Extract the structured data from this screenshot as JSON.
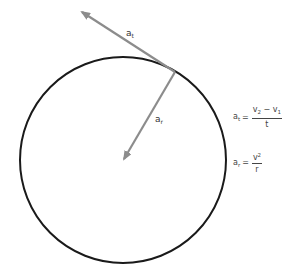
{
  "diagram": {
    "title": "",
    "colors": {
      "circle": "#1a1a1a",
      "arrow": "#8c8c8c",
      "text": "#333333"
    },
    "circle": {
      "cx": 123,
      "cy": 160,
      "r": 103
    },
    "tangent_point": {
      "x": 175,
      "y": 72
    },
    "arrows": {
      "tangential": {
        "label_base": "a",
        "label_sub": "t",
        "tip": {
          "x": 80,
          "y": 11
        }
      },
      "radial": {
        "label_base": "a",
        "label_sub": "r",
        "tip": {
          "x": 123,
          "y": 160
        }
      }
    },
    "equations": {
      "tangential": {
        "lhs_base": "a",
        "lhs_sub": "t",
        "equals": "=",
        "num_v2": "v",
        "num_v2_sub": "2",
        "minus": " − ",
        "num_v1": "v",
        "num_v1_sub": "1",
        "den": "t"
      },
      "radial": {
        "lhs_base": "a",
        "lhs_sub": "r",
        "equals": "=",
        "num_base": "v",
        "num_sup": "2",
        "den": "r"
      }
    }
  }
}
